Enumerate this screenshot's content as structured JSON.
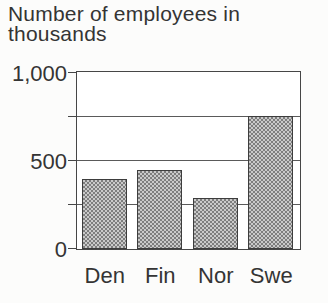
{
  "chart_data": {
    "type": "bar",
    "title": "Number of employees in thousands",
    "title_lines": [
      "Number of employees in",
      "thousands"
    ],
    "categories": [
      "Den",
      "Fin",
      "Nor",
      "Swe"
    ],
    "values": [
      395,
      450,
      290,
      755
    ],
    "xlabel": "",
    "ylabel": "Number of employees in thousands",
    "ylim": [
      0,
      1000
    ],
    "yticks": [
      {
        "value": 0,
        "label": "0"
      },
      {
        "value": 500,
        "label": "500"
      },
      {
        "value": 1000,
        "label": "1,000"
      }
    ],
    "tick_marks": [
      0,
      250,
      500,
      750,
      1000
    ],
    "gridlines": [
      250,
      500,
      750
    ],
    "grid": true,
    "legend": "none",
    "bar_fill_style": "gray-halftone-dither",
    "colors": {
      "background": "#fcfcfb",
      "plot_background": "#ffffff",
      "text": "#343434",
      "axis": "#464646",
      "grid_line": "#5a5a5a",
      "bar_border": "#3d3d3d",
      "bar_fill_base": "#c9c9c9",
      "bar_fill_dot": "#7d7d7d"
    }
  }
}
